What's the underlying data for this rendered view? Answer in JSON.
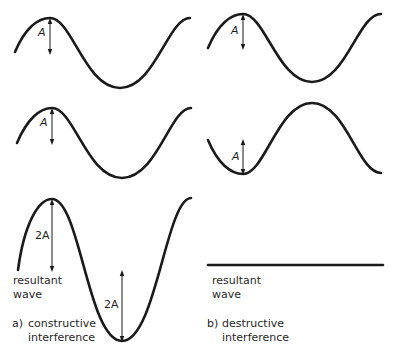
{
  "panels": {
    "a": {
      "wave1_label": "A",
      "wave2_label": "A",
      "resultant_peak_label": "2A",
      "resultant_trough_label": "2A",
      "resultant_line1": "resultant",
      "resultant_line2": "wave",
      "caption_marker": "a)",
      "caption_line1": "constructive",
      "caption_line2": "interference"
    },
    "b": {
      "wave1_label": "A",
      "wave2_label": "A",
      "resultant_line1": "resultant",
      "resultant_line2": "wave",
      "caption_marker": "b)",
      "caption_line1": "destructive",
      "caption_line2": "interference"
    }
  },
  "colors": {
    "stroke": "#1a1a1a",
    "background": "#ffffff"
  }
}
